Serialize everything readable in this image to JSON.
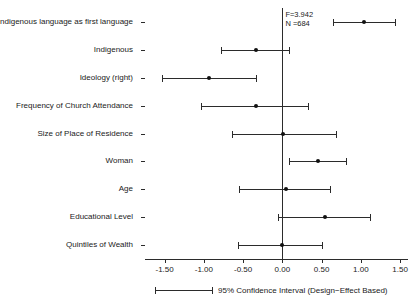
{
  "chart_data": {
    "type": "scatter",
    "subtype": "coefficient-forest-plot",
    "title": "",
    "xlabel": "",
    "ylabel": "",
    "xlim": [
      -1.75,
      1.6
    ],
    "xticks": [
      -1.5,
      -1.0,
      -0.5,
      0.0,
      0.5,
      1.0,
      1.5
    ],
    "xticklabels": [
      "-1.50",
      "-1.00",
      "-0.50",
      "0.00",
      "0.50",
      "1.00",
      "1.50"
    ],
    "grid": false,
    "zero_reference_line": 0.0,
    "categories": [
      "Indigenous language as first language",
      "Indigenous",
      "Ideology (right)",
      "Frequency of Church Attendance",
      "Size of Place of Residence",
      "Woman",
      "Age",
      "Educational Level",
      "Quintiles of Wealth"
    ],
    "estimates": [
      1.04,
      -0.33,
      -0.93,
      -0.34,
      0.01,
      0.45,
      0.04,
      0.54,
      -0.01
    ],
    "ci_low": [
      0.64,
      -0.78,
      -1.53,
      -1.04,
      -0.64,
      0.09,
      -0.55,
      -0.06,
      -0.56
    ],
    "ci_high": [
      1.43,
      0.08,
      -0.34,
      0.33,
      0.68,
      0.81,
      0.61,
      1.11,
      0.5
    ],
    "annotations": {
      "f_statistic": "F=3.942",
      "sample_size": "N =684"
    },
    "legend": {
      "position": "bottom",
      "entries": [
        "95% Confidence Interval (Design−Effect Based)"
      ]
    },
    "colors": {
      "point": "#111111",
      "line": "#2b2b2b",
      "axis": "#2b2b2b",
      "background": "#ffffff",
      "text": "#1a1a1a"
    }
  }
}
